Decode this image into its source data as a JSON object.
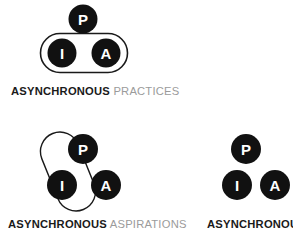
{
  "page": {
    "background_color": "#ffffff",
    "node_fill_color": "#111111",
    "node_label_color": "#ffffff",
    "outline_color": "#1a1a1a",
    "caption_strong_color": "#1a1a1a",
    "caption_light_color": "#9b9b9b"
  },
  "figures": [
    {
      "id": "asynchronous-practices",
      "caption_strong": "ASYNCHRONOUS",
      "caption_light": "PRACTICES",
      "nodes": [
        {
          "label": "P",
          "position": "top"
        },
        {
          "label": "I",
          "position": "bottom-left"
        },
        {
          "label": "A",
          "position": "bottom-right"
        }
      ],
      "grouping": {
        "shape": "capsule",
        "orientation": "horizontal",
        "encloses": [
          "I",
          "A"
        ]
      }
    },
    {
      "id": "asynchronous-aspirations",
      "caption_strong": "ASYNCHRONOUS",
      "caption_light": "ASPIRATIONS",
      "nodes": [
        {
          "label": "P",
          "position": "top"
        },
        {
          "label": "I",
          "position": "bottom-left"
        },
        {
          "label": "A",
          "position": "bottom-right"
        }
      ],
      "grouping": {
        "shape": "capsule",
        "orientation": "diagonal",
        "encloses": [
          "P",
          "I"
        ]
      }
    },
    {
      "id": "asynchronous",
      "caption_strong": "ASYNCHRONOUS",
      "caption_light": "",
      "nodes": [
        {
          "label": "P",
          "position": "top"
        },
        {
          "label": "I",
          "position": "bottom-left"
        },
        {
          "label": "A",
          "position": "bottom-right"
        }
      ],
      "grouping": null
    }
  ]
}
